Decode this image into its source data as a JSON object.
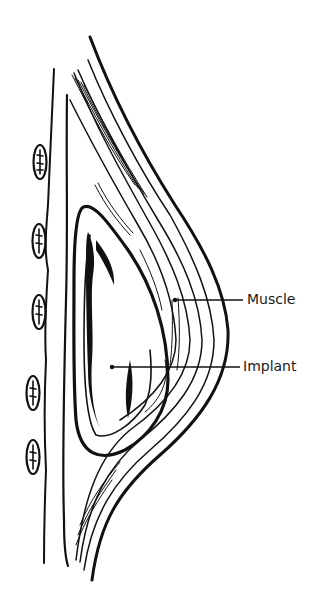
{
  "diagram": {
    "labels": {
      "muscle": "Muscle",
      "implant": "Implant"
    },
    "colors": {
      "ink": "#111111",
      "background": "#ffffff"
    }
  }
}
